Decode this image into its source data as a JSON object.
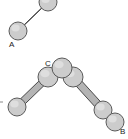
{
  "figure": {
    "background_color": "#ffffff",
    "width": 128,
    "height": 139,
    "node_fill_color": "#cccccc",
    "node_stroke_color": "#5a5a5a",
    "rod_fill_color": "#b4b4b4",
    "rod_stroke_color": "#4a4a4a",
    "label_color": "#1a1a1a"
  },
  "labels": {
    "a": "A",
    "b": "B",
    "c": "C"
  },
  "structures": [
    {
      "id": "segment-a",
      "name": "upper-left-segment",
      "label": "A",
      "nodes": [
        {
          "id": "a-terminal",
          "cx": 18,
          "cy": 31,
          "r": 9
        },
        {
          "id": "a-upper",
          "cx": 48,
          "cy": 2,
          "r": 9
        }
      ],
      "rods": [
        {
          "id": "a-rod",
          "x1": 18,
          "y1": 31,
          "x2": 48,
          "y2": 2,
          "thickness": 7
        }
      ]
    },
    {
      "id": "chevron-b-c",
      "name": "lower-chevron-structure",
      "label": "B",
      "vertex_label": "C",
      "nodes": [
        {
          "id": "c-apex",
          "cx": 62,
          "cy": 68,
          "r": 10
        },
        {
          "id": "c-left",
          "cx": 48,
          "cy": 77,
          "r": 10
        },
        {
          "id": "c-right",
          "cx": 73,
          "cy": 77,
          "r": 10
        },
        {
          "id": "left-terminal",
          "cx": 17,
          "cy": 107,
          "r": 9
        },
        {
          "id": "right-inner",
          "cx": 103,
          "cy": 110,
          "r": 9
        },
        {
          "id": "b-terminal",
          "cx": 115,
          "cy": 122,
          "r": 9
        }
      ],
      "rods": [
        {
          "id": "left-arm-rod",
          "x1": 48,
          "y1": 77,
          "x2": 17,
          "y2": 107,
          "thickness": 7
        },
        {
          "id": "right-arm-rod",
          "x1": 73,
          "y1": 77,
          "x2": 103,
          "y2": 110,
          "thickness": 7
        }
      ]
    }
  ],
  "label_positions": {
    "a": {
      "x": 9,
      "y": 47
    },
    "b": {
      "x": 120,
      "y": 134
    },
    "c": {
      "x": 45,
      "y": 66
    }
  },
  "marks": [
    {
      "id": "edge-stub-left",
      "x": 0,
      "y": 102,
      "name": "left-edge-stub"
    }
  ]
}
